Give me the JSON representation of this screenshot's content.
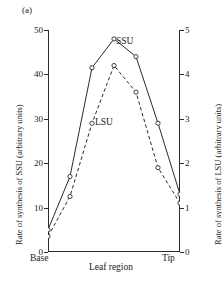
{
  "panel": {
    "label": "(a)"
  },
  "axes": {
    "left": {
      "title": "Rate of synthesis of SSU (arbitrary units)",
      "ticks": [
        0,
        10,
        20,
        30,
        40,
        50
      ],
      "min": 0,
      "max": 50
    },
    "right": {
      "title": "Rate of synthesis of LSU (arbitrary units)",
      "ticks": [
        0,
        1,
        2,
        3,
        4,
        5
      ],
      "min": 0,
      "max": 5
    },
    "x": {
      "title": "Leaf region",
      "tick_labels": [
        "Base",
        "Tip"
      ]
    }
  },
  "chart_data": {
    "type": "line",
    "title": "",
    "xlabel": "Leaf region",
    "ylabel": "Rate of synthesis of SSU (arbitrary units)",
    "y2label": "Rate of synthesis of LSU (arbitrary units)",
    "xlim": [
      0,
      6
    ],
    "ylim": [
      0,
      50
    ],
    "y2lim": [
      0,
      5
    ],
    "grid": false,
    "legend": "inline-annotation",
    "x": [
      0,
      1,
      2,
      3,
      4,
      5,
      6
    ],
    "x_tick_labels": [
      "Base",
      "",
      "",
      "",
      "",
      "",
      "Tip"
    ],
    "series": [
      {
        "name": "SSU",
        "axis": "left",
        "linestyle": "solid",
        "marker": "open-circle",
        "color": "#2b2b2b",
        "values": [
          5,
          17,
          41.5,
          48,
          44,
          29,
          13
        ]
      },
      {
        "name": "LSU",
        "axis": "right",
        "linestyle": "dashed",
        "marker": "open-circle",
        "color": "#2b2b2b",
        "values": [
          0.35,
          1.25,
          2.9,
          4.2,
          3.6,
          1.9,
          1.1
        ]
      }
    ],
    "annotations": [
      {
        "text": "SSU",
        "series": "SSU"
      },
      {
        "text": "LSU",
        "series": "LSU"
      }
    ]
  }
}
